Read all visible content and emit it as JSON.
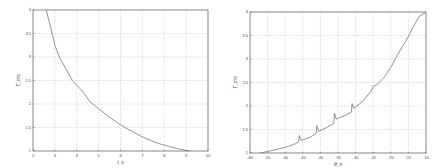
{
  "chart_data": [
    {
      "type": "line",
      "title": "",
      "xlabel": "t_s",
      "ylabel": "T_ms",
      "xlim": [
        2,
        10
      ],
      "ylim": [
        1,
        4
      ],
      "xticks": [
        2,
        3,
        4,
        5,
        6,
        7,
        8,
        9,
        10
      ],
      "yticks": [
        1,
        1.5,
        2,
        2.5,
        3,
        3.5,
        4
      ],
      "grid": true,
      "frame": {
        "x0": 33,
        "y0": 10,
        "x1": 208,
        "y1": 151
      },
      "series": [
        {
          "name": "T",
          "x": [
            2.6,
            2.8,
            3.0,
            3.2,
            3.5,
            3.8,
            4.0,
            4.3,
            4.6,
            5.0,
            5.4,
            5.8,
            6.2,
            6.6,
            7.0,
            7.4,
            7.8,
            8.2,
            8.6,
            9.0,
            9.15
          ],
          "y": [
            4.0,
            3.65,
            3.25,
            3.0,
            2.75,
            2.5,
            2.4,
            2.25,
            2.05,
            1.9,
            1.75,
            1.62,
            1.5,
            1.4,
            1.3,
            1.22,
            1.15,
            1.1,
            1.05,
            1.01,
            1.0
          ]
        }
      ]
    },
    {
      "type": "line",
      "title": "",
      "xlabel": "θ_s",
      "ylabel": "T_ms",
      "xlim": [
        -60,
        -10
      ],
      "ylim": [
        1,
        4
      ],
      "xticks": [
        -60,
        -55,
        -50,
        -45,
        -40,
        -35,
        -30,
        -25,
        -20,
        -15,
        -10
      ],
      "yticks": [
        1,
        1.5,
        2,
        2.5,
        3,
        3.5,
        4
      ],
      "grid": true,
      "frame": {
        "x0": 250,
        "y0": 12,
        "x1": 426,
        "y1": 153
      },
      "series": [
        {
          "name": "T",
          "x": [
            -57,
            -54,
            -50,
            -47,
            -46.2,
            -46,
            -45.5,
            -43,
            -41.2,
            -41,
            -40.5,
            -38,
            -36.2,
            -36,
            -35.5,
            -33,
            -31.2,
            -31,
            -30.5,
            -28,
            -25.5,
            -25,
            -24,
            -22,
            -20,
            -18,
            -16,
            -15,
            -13.5,
            -12,
            -10
          ],
          "y": [
            1.0,
            1.05,
            1.12,
            1.2,
            1.24,
            1.37,
            1.27,
            1.33,
            1.42,
            1.58,
            1.46,
            1.55,
            1.63,
            1.85,
            1.72,
            1.8,
            1.87,
            2.05,
            1.95,
            2.1,
            2.32,
            2.42,
            2.45,
            2.6,
            2.82,
            3.1,
            3.35,
            3.48,
            3.7,
            3.9,
            4.0
          ]
        }
      ]
    }
  ],
  "charts": {
    "left": {
      "xlabel": "t_s",
      "ylabel": "T_ms",
      "xtick_labels": [
        "2",
        "3",
        "4",
        "5",
        "6",
        "7",
        "8",
        "9",
        "10"
      ],
      "ytick_labels": [
        "1",
        "1.5",
        "2",
        "2.5",
        "3",
        "3.5",
        "4"
      ]
    },
    "right": {
      "xlabel": "θ_s",
      "ylabel": "T_ms",
      "xtick_labels": [
        "-60",
        "-55",
        "-50",
        "-45",
        "-40",
        "-35",
        "-30",
        "-25",
        "-20",
        "-15",
        "-10"
      ],
      "ytick_labels": [
        "1",
        "1.5",
        "2",
        "2.5",
        "3",
        "3.5",
        "4"
      ]
    }
  },
  "colors": {
    "frame": "#555555",
    "grid": "#bbbbbb",
    "line": "#777777"
  }
}
